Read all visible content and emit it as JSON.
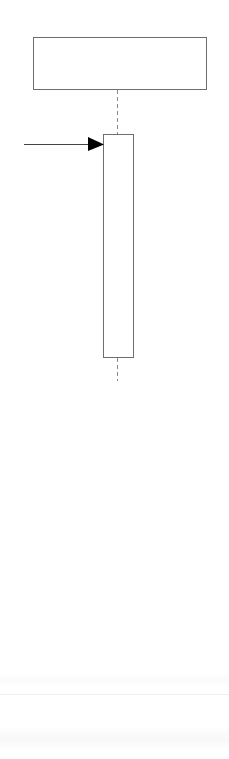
{
  "page": {
    "width": 229,
    "height": 759,
    "background_color": "#ffffff",
    "media": "scanned-white-page"
  },
  "diagram": {
    "type": "block-schematic",
    "title": "",
    "stroke_color": "#6e6e6e",
    "arrow_color": "#000000",
    "dash_color": "#8a8a8a",
    "shapes": [
      {
        "id": "upper-block",
        "kind": "rectangle",
        "label": "",
        "x": 33,
        "y": 37,
        "width": 173,
        "height": 53,
        "fill": "#ffffff",
        "stroke": "#6e6e6e",
        "stroke_width": 1
      },
      {
        "id": "lower-column",
        "kind": "rectangle",
        "label": "",
        "x": 103,
        "y": 134,
        "width": 30,
        "height": 224,
        "fill": "#ffffff",
        "stroke": "#6e6e6e",
        "stroke_width": 1
      }
    ],
    "center_line": {
      "id": "axis-centerline",
      "kind": "dashed-line",
      "orientation": "vertical",
      "x": 117.5,
      "segments": [
        {
          "y_start": 90,
          "y_end": 134
        },
        {
          "y_start": 358,
          "y_end": 381
        }
      ],
      "dash": "4 3",
      "color": "#8a8a8a",
      "stroke_width": 1
    },
    "annotations": [
      {
        "id": "inlet-arrow",
        "kind": "arrow",
        "label": "",
        "direction": "right",
        "x_start": 24,
        "x_end": 104,
        "y": 144,
        "head_length": 16,
        "head_half_width": 7,
        "color": "#000000",
        "stroke_width": 1
      }
    ]
  },
  "artifacts": {
    "scan_line_label": "paper-edge-line",
    "scan_smudge_label": "scanner-bleed-through"
  }
}
